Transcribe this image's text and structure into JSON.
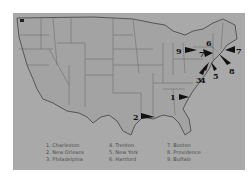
{
  "map": {
    "title": "",
    "region": "United States",
    "colors": {
      "background": "#ffffff",
      "panel": "#a9a9a9",
      "land": "#a3a3a3",
      "border": "#555555",
      "marker": "#111111"
    },
    "markers": [
      {
        "number": "1",
        "city": "Charleston",
        "label_x": 160,
        "label_y": 82,
        "arrow_to_x": 175,
        "arrow_to_y": 84
      },
      {
        "number": "2",
        "city": "New Orleans",
        "label_x": 121,
        "label_y": 102,
        "arrow_to_x": 140,
        "arrow_to_y": 103
      },
      {
        "number": "3",
        "city": "Philadelphia",
        "label_x": 184,
        "label_y": 63,
        "arrow_to_x": 194,
        "arrow_to_y": 52
      },
      {
        "number": "4",
        "city": "Trenton",
        "label_x": 188,
        "label_y": 58,
        "arrow_to_x": 196,
        "arrow_to_y": 50
      },
      {
        "number": "5",
        "city": "New York",
        "label_x": 207,
        "label_y": 58,
        "arrow_to_x": 199,
        "arrow_to_y": 49
      },
      {
        "number": "6",
        "city": "Hartford",
        "label_x": 195,
        "label_y": 28,
        "arrow_to_x": 203,
        "arrow_to_y": 38
      },
      {
        "number": "7",
        "city": "Boston",
        "label_x": 228,
        "label_y": 38,
        "arrow_to_x": 214,
        "arrow_to_y": 37
      },
      {
        "number": "8",
        "city": "Providence",
        "label_x": 220,
        "label_y": 53,
        "arrow_to_x": 208,
        "arrow_to_y": 42
      },
      {
        "number": "9",
        "city": "Buffalo",
        "label_x": 164,
        "label_y": 37,
        "arrow_to_x": 179,
        "arrow_to_y": 37
      }
    ]
  },
  "legend": {
    "items": [
      {
        "text": "1. Charleston"
      },
      {
        "text": "4. Trenton"
      },
      {
        "text": "7. Boston"
      },
      {
        "text": "2. New Orleans"
      },
      {
        "text": "5. New York"
      },
      {
        "text": "8. Providence"
      },
      {
        "text": "3. Philadelphia"
      },
      {
        "text": "6. Hartford"
      },
      {
        "text": "9. Buffalo"
      }
    ]
  }
}
